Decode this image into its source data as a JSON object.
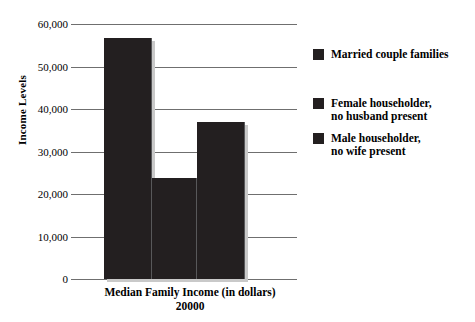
{
  "chart_data": {
    "type": "bar",
    "title": "",
    "xlabel": "Median Family Income (in dollars)",
    "xlabel_sub": "20000",
    "ylabel": "Income Levels",
    "categories": [
      "Married couple families",
      "Female householder, no husband present",
      "Male householder, no wife present"
    ],
    "values": [
      56600,
      23800,
      36900
    ],
    "ylim": [
      0,
      60000
    ],
    "ytick_labels": [
      "60,000",
      "50,000",
      "40,000",
      "30,000",
      "20,000",
      "10,000",
      "0"
    ],
    "ytick_values": [
      60000,
      50000,
      40000,
      30000,
      20000,
      10000,
      0
    ],
    "grid": true,
    "legend_position": "right",
    "bar_color": "#231f20",
    "gridline_color": "#6f6f6f",
    "background_color": "#ffffff"
  },
  "axes": {
    "y_title": "Income Levels",
    "x_title": "Median Family Income (in dollars)",
    "x_title_sub": "20000"
  },
  "legend": {
    "entries": [
      {
        "label": "Married couple families",
        "color": "#231f20"
      },
      {
        "label": "Female householder,\nno husband present",
        "color": "#231f20"
      },
      {
        "label": "Male householder,\nno wife present",
        "color": "#231f20"
      }
    ]
  }
}
